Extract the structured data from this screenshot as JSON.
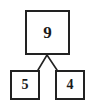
{
  "diagram": {
    "kind": "number-bond",
    "background_color": "#ffffff",
    "stroke_color": "#222222",
    "text_color": "#1a1a1a",
    "whole": {
      "value": "9"
    },
    "parts": [
      {
        "value": "5"
      },
      {
        "value": "4"
      }
    ],
    "connectors": [
      {
        "from": "whole-bottom-center",
        "to": "part-left-top-right-corner",
        "x1": 47,
        "y1": 55,
        "x2": 38,
        "y2": 70
      },
      {
        "from": "whole-bottom-center",
        "to": "part-right-top-left-corner",
        "x1": 47,
        "y1": 55,
        "x2": 57,
        "y2": 70
      }
    ]
  }
}
